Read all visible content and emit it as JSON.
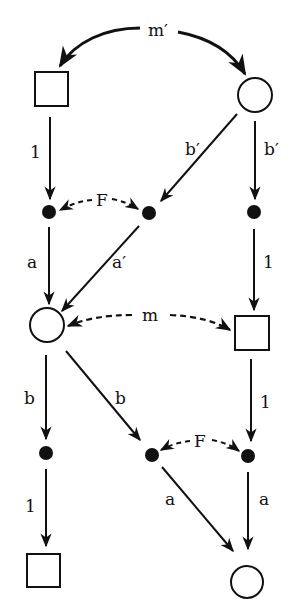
{
  "diagram": {
    "colors": {
      "ink": "#111111",
      "background": "#ffffff"
    },
    "nodes": [
      {
        "id": "sq_top",
        "shape": "square",
        "x": 35,
        "y": 72,
        "size": 33
      },
      {
        "id": "ci_top",
        "shape": "circle",
        "cx": 255,
        "cy": 95,
        "r": 17
      },
      {
        "id": "dot_l1",
        "shape": "dot",
        "cx": 49,
        "cy": 212,
        "r": 7
      },
      {
        "id": "dot_m1",
        "shape": "dot",
        "cx": 149,
        "cy": 213,
        "r": 7
      },
      {
        "id": "dot_r1",
        "shape": "dot",
        "cx": 254,
        "cy": 212,
        "r": 7
      },
      {
        "id": "ci_mid",
        "shape": "circle",
        "cx": 47,
        "cy": 325,
        "r": 17
      },
      {
        "id": "sq_mid",
        "shape": "square",
        "x": 235,
        "y": 316,
        "size": 34
      },
      {
        "id": "dot_l2",
        "shape": "dot",
        "cx": 46,
        "cy": 453,
        "r": 7
      },
      {
        "id": "dot_m2",
        "shape": "dot",
        "cx": 152,
        "cy": 455,
        "r": 7
      },
      {
        "id": "dot_r2",
        "shape": "dot",
        "cx": 248,
        "cy": 456,
        "r": 7
      },
      {
        "id": "sq_bot",
        "shape": "square",
        "x": 27,
        "y": 554,
        "size": 33
      },
      {
        "id": "ci_bot",
        "shape": "circle",
        "cx": 247,
        "cy": 582,
        "r": 16
      }
    ],
    "labels": {
      "m_prime": "m′",
      "one_top_left": "1",
      "b_prime_diag": "b′",
      "b_prime_right": "b′",
      "F_top": "F",
      "a_left": "a",
      "a_prime": "a′",
      "one_right": "1",
      "m": "m",
      "b_left": "b",
      "b_diag": "b",
      "one_right_2": "1",
      "F_bottom": "F",
      "one_bottom_left": "1",
      "a_diag": "a",
      "a_right": "a"
    },
    "edges": [
      {
        "from": "m_prime_arc",
        "to": "sq_top",
        "label": "m′",
        "style": "solid-curved"
      },
      {
        "from": "m_prime_arc",
        "to": "ci_top",
        "label": "m′",
        "style": "solid-curved"
      },
      {
        "from": "sq_top",
        "to": "dot_l1",
        "label": "1",
        "style": "solid"
      },
      {
        "from": "ci_top",
        "to": "dot_m1",
        "label": "b′",
        "style": "solid"
      },
      {
        "from": "ci_top",
        "to": "dot_r1",
        "label": "b′",
        "style": "solid"
      },
      {
        "from": "F_top",
        "to": "dot_l1",
        "label": "F",
        "style": "dashed"
      },
      {
        "from": "F_top",
        "to": "dot_m1",
        "label": "F",
        "style": "dashed"
      },
      {
        "from": "dot_l1",
        "to": "ci_mid",
        "label": "a",
        "style": "solid"
      },
      {
        "from": "dot_m1",
        "to": "ci_mid",
        "label": "a′",
        "style": "solid"
      },
      {
        "from": "dot_r1",
        "to": "sq_mid",
        "label": "1",
        "style": "solid"
      },
      {
        "from": "m_arc",
        "to": "ci_mid",
        "label": "m",
        "style": "dashed"
      },
      {
        "from": "m_arc",
        "to": "sq_mid",
        "label": "m",
        "style": "dashed"
      },
      {
        "from": "ci_mid",
        "to": "dot_l2",
        "label": "b",
        "style": "solid"
      },
      {
        "from": "ci_mid",
        "to": "dot_m2",
        "label": "b",
        "style": "solid"
      },
      {
        "from": "sq_mid",
        "to": "dot_r2",
        "label": "1",
        "style": "solid"
      },
      {
        "from": "F_bottom",
        "to": "dot_m2",
        "label": "F",
        "style": "dashed"
      },
      {
        "from": "F_bottom",
        "to": "dot_r2",
        "label": "F",
        "style": "dashed"
      },
      {
        "from": "dot_l2",
        "to": "sq_bot",
        "label": "1",
        "style": "solid"
      },
      {
        "from": "dot_m2",
        "to": "ci_bot",
        "label": "a",
        "style": "solid"
      },
      {
        "from": "dot_r2",
        "to": "ci_bot",
        "label": "a",
        "style": "solid"
      }
    ]
  }
}
